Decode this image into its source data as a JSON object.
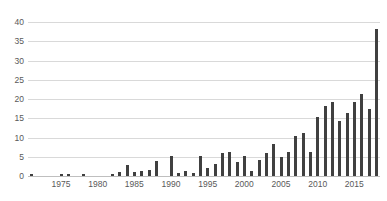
{
  "chart_data": {
    "type": "bar",
    "title": "",
    "subtitle": "",
    "xlabel": "",
    "ylabel": "",
    "xlim": [
      1970.5,
      2018.5
    ],
    "ylim": [
      0,
      40
    ],
    "grid": true,
    "legend": null,
    "legend_position": "none",
    "y_ticks": [
      40,
      35,
      30,
      25,
      20,
      15,
      10,
      5,
      0
    ],
    "y_tick_step": 5,
    "x_ticks": [
      1975,
      1980,
      1985,
      1990,
      1995,
      2000,
      2005,
      2010,
      2015
    ],
    "x_tick_step": 5,
    "bar_color": "#404040",
    "gridline_color": "#d9d9d9",
    "categories": [
      1971,
      1972,
      1973,
      1974,
      1975,
      1976,
      1977,
      1978,
      1979,
      1980,
      1981,
      1982,
      1983,
      1984,
      1985,
      1986,
      1987,
      1988,
      1989,
      1990,
      1991,
      1992,
      1993,
      1994,
      1995,
      1996,
      1997,
      1998,
      1999,
      2000,
      2001,
      2002,
      2003,
      2004,
      2005,
      2006,
      2007,
      2008,
      2009,
      2010,
      2011,
      2012,
      2013,
      2014,
      2015,
      2016,
      2017,
      2018
    ],
    "values": [
      0.4,
      0,
      0,
      0,
      0.5,
      0.6,
      0,
      0.5,
      0,
      0,
      0,
      0.6,
      1.0,
      2.9,
      1.0,
      1.4,
      1.5,
      3.9,
      0,
      5.1,
      0.9,
      1.4,
      0.8,
      5.1,
      2.1,
      3.2,
      6.1,
      6.2,
      3.7,
      5.2,
      1.4,
      4.1,
      6.1,
      8.3,
      5.0,
      6.2,
      10.3,
      11.2,
      6.2,
      15.2,
      18.2,
      19.2,
      14.4,
      16.4,
      19.3,
      21.4,
      17.3,
      38.3
    ]
  }
}
